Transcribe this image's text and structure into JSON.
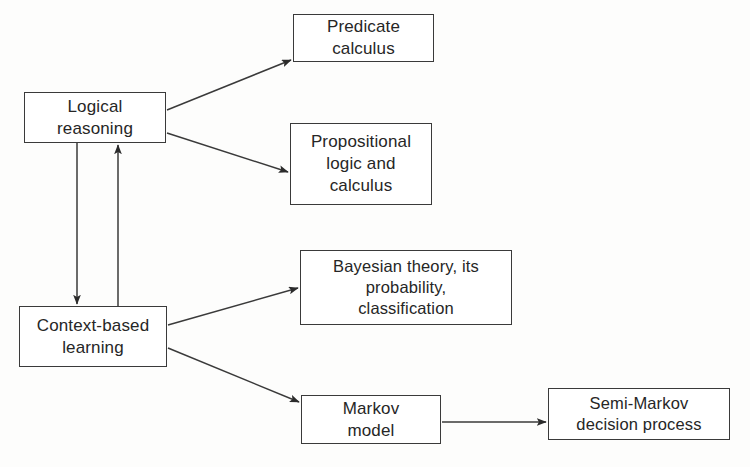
{
  "diagram": {
    "type": "flowchart",
    "background_color": "#fdfdfc",
    "stroke_color": "#3a3a3a",
    "text_color": "#262626",
    "nodes": [
      {
        "id": "logical-reasoning",
        "label": "Logical\nreasoning"
      },
      {
        "id": "predicate-calculus",
        "label": "Predicate\ncalculus"
      },
      {
        "id": "propositional-logic",
        "label": "Propositional\nlogic and\ncalculus"
      },
      {
        "id": "context-based-learning",
        "label": "Context-based\nlearning"
      },
      {
        "id": "bayesian-theory",
        "label": "Bayesian theory, its\nprobability,\nclassification"
      },
      {
        "id": "markov-model",
        "label": "Markov\nmodel"
      },
      {
        "id": "semi-markov-decision",
        "label": "Semi-Markov\ndecision process"
      }
    ],
    "edges": [
      {
        "from": "logical-reasoning",
        "to": "predicate-calculus",
        "style": "solid-arrow",
        "direction": "right-up"
      },
      {
        "from": "logical-reasoning",
        "to": "propositional-logic",
        "style": "solid-arrow",
        "direction": "right-down"
      },
      {
        "from": "logical-reasoning",
        "to": "context-based-learning",
        "style": "solid-arrow",
        "direction": "down"
      },
      {
        "from": "context-based-learning",
        "to": "logical-reasoning",
        "style": "solid-arrow",
        "direction": "up"
      },
      {
        "from": "context-based-learning",
        "to": "bayesian-theory",
        "style": "solid-arrow",
        "direction": "right-up"
      },
      {
        "from": "context-based-learning",
        "to": "markov-model",
        "style": "solid-arrow",
        "direction": "right-down"
      },
      {
        "from": "markov-model",
        "to": "semi-markov-decision",
        "style": "solid-arrow",
        "direction": "right"
      }
    ]
  }
}
